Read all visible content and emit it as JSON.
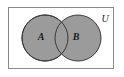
{
  "figure": {
    "name": "venn-diagram-two-sets",
    "background_color": "#ffffff"
  },
  "universe": {
    "label": "U",
    "label_x": 105,
    "label_y": 20,
    "rect": {
      "x": 8.5,
      "y": 7.5,
      "width": 105,
      "height": 61
    },
    "stroke_color": "#8a8a8a",
    "fill_color": "#ffffff",
    "stroke_width": 1
  },
  "sets": [
    {
      "label": "A",
      "label_x": 41,
      "label_y": 38,
      "cx": 45,
      "cy": 38,
      "r": 23,
      "fill_color": "#9b9b9b",
      "stroke_color": "#3a3a3a",
      "stroke_width": 1
    },
    {
      "label": "B",
      "label_x": 76,
      "label_y": 38,
      "cx": 78,
      "cy": 38,
      "r": 23,
      "fill_color": "#9b9b9b",
      "stroke_color": "#3a3a3a",
      "stroke_width": 1
    }
  ],
  "chart_data": {
    "type": "diagram",
    "diagram_kind": "venn",
    "title": "",
    "set_count": 2,
    "set_labels": [
      "A",
      "B"
    ],
    "universe_label": "U",
    "regions": [
      "A only",
      "A and B",
      "B only",
      "outside A and B"
    ],
    "shaded_regions": [
      "A only",
      "A and B",
      "B only"
    ],
    "unshaded_regions": [
      "outside A and B"
    ],
    "shade_color": "#9b9b9b",
    "outline_color": "#3a3a3a",
    "frame_color": "#8a8a8a"
  }
}
